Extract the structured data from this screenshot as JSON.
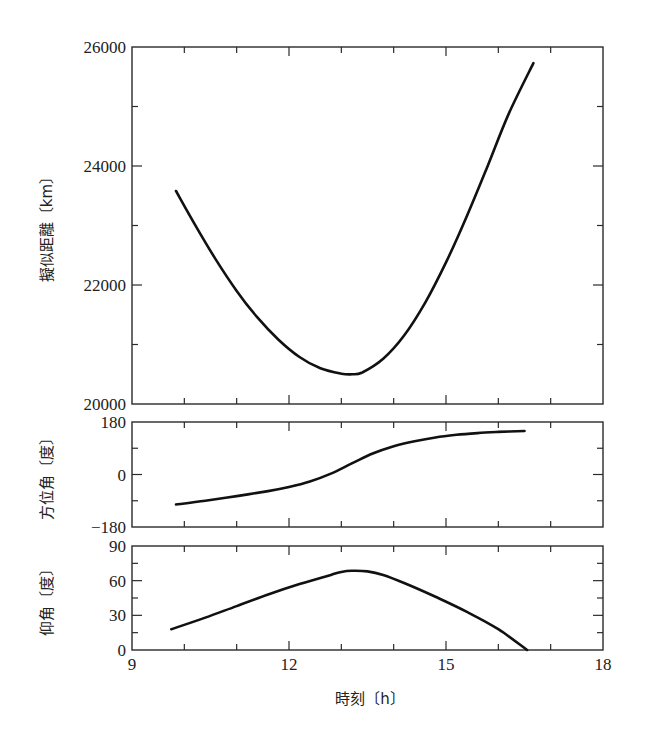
{
  "chart_data": [
    {
      "type": "line",
      "panel": "top",
      "title": "",
      "xlabel": "",
      "ylabel": "擬似距離〔km〕",
      "xlim": [
        9,
        18
      ],
      "ylim": [
        20000,
        26000
      ],
      "yticks": [
        20000,
        22000,
        24000,
        26000
      ],
      "ytick_labels": [
        "20000",
        "22000",
        "24000",
        "26000"
      ],
      "minor_ytick_step": 1000,
      "grid": false,
      "series": [
        {
          "name": "擬似距離",
          "x": [
            9.84,
            10.2,
            10.6,
            11.0,
            11.4,
            11.8,
            12.2,
            12.6,
            13.0,
            13.2,
            13.4,
            13.8,
            14.2,
            14.6,
            15.0,
            15.4,
            15.8,
            16.2,
            16.67
          ],
          "values": [
            23580,
            23020,
            22430,
            21900,
            21450,
            21080,
            20790,
            20600,
            20510,
            20500,
            20530,
            20760,
            21150,
            21700,
            22380,
            23160,
            24010,
            24880,
            25730
          ]
        }
      ]
    },
    {
      "type": "line",
      "panel": "middle",
      "title": "",
      "xlabel": "",
      "ylabel": "方位角〔度〕",
      "xlim": [
        9,
        18
      ],
      "ylim": [
        -180,
        180
      ],
      "yticks": [
        -180,
        0,
        180
      ],
      "ytick_labels": [
        "−180",
        "0",
        "180"
      ],
      "minor_ytick_step": 90,
      "grid": false,
      "series": [
        {
          "name": "方位角",
          "x": [
            9.84,
            10.4,
            11.0,
            11.6,
            12.0,
            12.4,
            12.8,
            13.2,
            13.6,
            14.0,
            14.4,
            14.8,
            15.2,
            15.6,
            16.0,
            16.5
          ],
          "values": [
            -103,
            -90,
            -74,
            -57,
            -43,
            -24,
            3,
            38,
            72,
            97,
            114,
            127,
            136,
            142,
            146,
            149
          ]
        }
      ]
    },
    {
      "type": "line",
      "panel": "bottom",
      "title": "",
      "xlabel": "時刻〔h〕",
      "ylabel": "仰角〔度〕",
      "xlim": [
        9,
        18
      ],
      "ylim": [
        0,
        90
      ],
      "xticks": [
        9,
        12,
        15,
        18
      ],
      "xtick_labels": [
        "9",
        "12",
        "15",
        "18"
      ],
      "minor_xtick_step": 1,
      "yticks": [
        0,
        30,
        60,
        90
      ],
      "ytick_labels": [
        "0",
        "30",
        "60",
        "90"
      ],
      "minor_ytick_step": 15,
      "grid": false,
      "series": [
        {
          "name": "仰角",
          "x": [
            9.75,
            10.4,
            11.0,
            11.6,
            12.2,
            12.8,
            13.0,
            13.2,
            13.5,
            13.8,
            14.2,
            14.8,
            15.4,
            16.0,
            16.55
          ],
          "values": [
            18,
            28,
            38,
            48,
            57,
            65,
            67.5,
            68.5,
            68,
            65,
            58,
            46,
            33,
            18,
            0
          ]
        }
      ]
    }
  ],
  "labels": {
    "top_ylabel": "擬似距離〔km〕",
    "middle_ylabel": "方位角〔度〕",
    "bottom_ylabel": "仰角〔度〕",
    "xlabel": "時刻〔h〕"
  },
  "colors": {
    "line": "#111111",
    "frame": "#2a2a2a",
    "background": "#ffffff"
  }
}
